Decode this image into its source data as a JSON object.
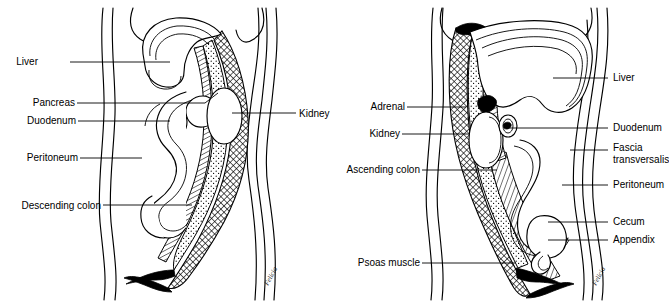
{
  "figure": {
    "background_color": "#ffffff",
    "line_color": "#000000"
  },
  "panels": [
    {
      "id": "left-panel",
      "name": "left-sagittal-section",
      "signature": "Felicia",
      "labels": [
        {
          "id": "liver",
          "text": "Liver",
          "side": "left",
          "text_x": 38,
          "text_y": 65,
          "line": [
            [
              70,
              62
            ],
            [
              170,
              62
            ]
          ]
        },
        {
          "id": "pancreas",
          "text": "Pancreas",
          "side": "left",
          "text_x": 27,
          "text_y": 106,
          "line": [
            [
              77,
              103
            ],
            [
              205,
              103
            ],
            [
              218,
              92
            ]
          ]
        },
        {
          "id": "duodenum",
          "text": "Duodenum",
          "side": "left",
          "text_x": 22,
          "text_y": 124,
          "line": [
            [
              78,
              121
            ],
            [
              172,
              121
            ]
          ]
        },
        {
          "id": "peritoneum",
          "text": "Peritoneum",
          "side": "left",
          "text_x": 18,
          "text_y": 161,
          "line": [
            [
              80,
              158
            ],
            [
              142,
              158
            ]
          ]
        },
        {
          "id": "descending-colon",
          "text": "Descending colon",
          "side": "left",
          "text_x": 10,
          "text_y": 209,
          "line": [
            [
              103,
              205
            ],
            [
              192,
              205
            ]
          ]
        },
        {
          "id": "kidney",
          "text": "Kidney",
          "side": "right",
          "text_x": 299,
          "text_y": 117,
          "line": [
            [
              265,
              113
            ],
            [
              232,
              113
            ]
          ]
        }
      ]
    },
    {
      "id": "right-panel",
      "name": "right-sagittal-section",
      "signature": "Felicia",
      "labels": [
        {
          "id": "adrenal",
          "text": "Adrenal",
          "side": "left",
          "text_x": 366,
          "text_y": 110,
          "line": [
            [
              407,
              107
            ],
            [
              465,
              107
            ]
          ]
        },
        {
          "id": "kidney",
          "text": "Kidney",
          "side": "left",
          "text_x": 366,
          "text_y": 137,
          "line": [
            [
              402,
              134
            ],
            [
              470,
              134
            ]
          ]
        },
        {
          "id": "ascending-colon",
          "text": "Ascending colon",
          "side": "left",
          "text_x": 345,
          "text_y": 173,
          "line": [
            [
              422,
              170
            ],
            [
              495,
              170
            ]
          ]
        },
        {
          "id": "psoas-muscle",
          "text": "Psoas muscle",
          "side": "left",
          "text_x": 355,
          "text_y": 266,
          "line": [
            [
              422,
              263
            ],
            [
              512,
              263
            ]
          ]
        },
        {
          "id": "liver",
          "text": "Liver",
          "side": "right",
          "text_x": 620,
          "text_y": 81,
          "line": [
            [
              617,
              78
            ],
            [
              553,
              78
            ]
          ]
        },
        {
          "id": "duodenum",
          "text": "Duodenum",
          "side": "right",
          "text_x": 611,
          "text_y": 131,
          "line": [
            [
              608,
              128
            ],
            [
              506,
              128
            ]
          ]
        },
        {
          "id": "fascia-transversalis",
          "text": "Fascia",
          "text2": "transversalis",
          "side": "right",
          "text_x": 611,
          "text_y": 151,
          "text2_y": 162,
          "line": [
            [
              608,
              148
            ],
            [
              568,
              148
            ]
          ]
        },
        {
          "id": "peritoneum",
          "text": "Peritoneum",
          "side": "right",
          "text_x": 611,
          "text_y": 188,
          "line": [
            [
              608,
              185
            ],
            [
              560,
              185
            ]
          ]
        },
        {
          "id": "cecum",
          "text": "Cecum",
          "side": "right",
          "text_x": 611,
          "text_y": 225,
          "line": [
            [
              608,
              222
            ],
            [
              545,
              222
            ]
          ]
        },
        {
          "id": "appendix",
          "text": "Appendix",
          "side": "right",
          "text_x": 611,
          "text_y": 243,
          "line": [
            [
              608,
              240
            ],
            [
              545,
              240
            ]
          ]
        }
      ]
    }
  ],
  "shading": {
    "stipple_name": "retroperitoneal-fat-stipple",
    "crosshatch_name": "fascia-crosshatch",
    "diagonal_name": "muscle-diagonal-hatch",
    "solid_name": "solid-black-band"
  }
}
